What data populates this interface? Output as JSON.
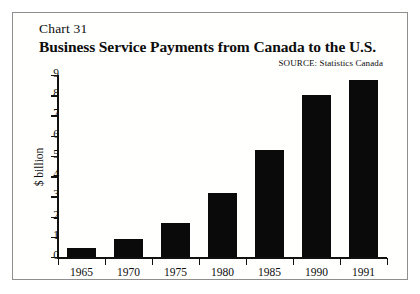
{
  "figure": {
    "chart_number": "Chart 31",
    "title": "Business Service Payments from Canada to the U.S.",
    "source_label": "SOURCE:",
    "source_value": "Statistics Canada",
    "border_color": "#8e8e8e",
    "bar_color": "#0a0a0a",
    "background_color": "#ffffff"
  },
  "chart_data": {
    "type": "bar",
    "title": "Business Service Payments from Canada to the U.S.",
    "subtitle": "Chart 31",
    "categories": [
      "1965",
      "1970",
      "1975",
      "1980",
      "1985",
      "1990",
      "1991"
    ],
    "values": [
      0.45,
      0.9,
      1.7,
      3.15,
      5.3,
      8.0,
      8.75
    ],
    "series": [
      {
        "name": "Business service payments",
        "values": [
          0.45,
          0.9,
          1.7,
          3.15,
          5.3,
          8.0,
          8.75
        ]
      }
    ],
    "xlabel": "",
    "ylabel": "$ billion",
    "ylim": [
      0,
      9
    ],
    "yticks": [
      0,
      1,
      2,
      3,
      4,
      5,
      6,
      7,
      8,
      9
    ],
    "ytick_labels": [
      "0",
      "1",
      "2",
      "3",
      "4",
      "5",
      "6",
      "7",
      "8",
      "9"
    ],
    "grid": false,
    "legend": false,
    "annotations": [
      "SOURCE: Statistics Canada"
    ]
  }
}
